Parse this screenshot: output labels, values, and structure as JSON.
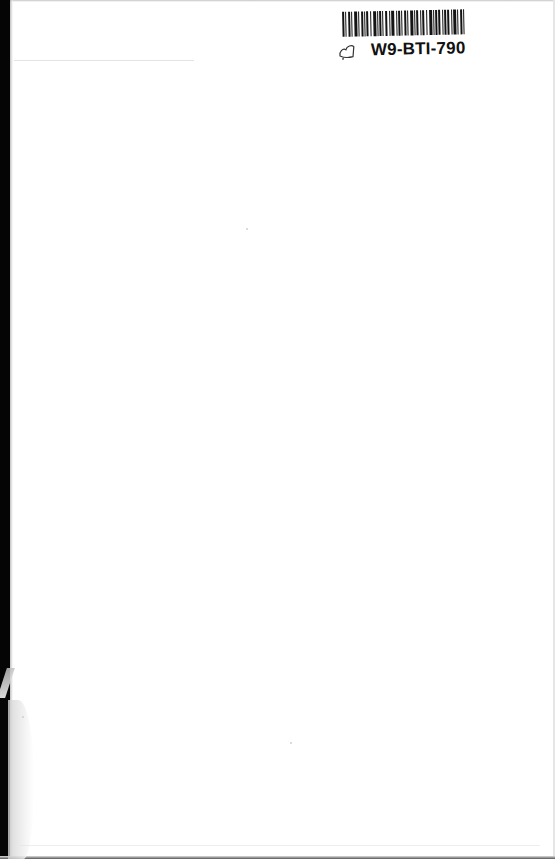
{
  "document": {
    "type": "scanned-blank-page",
    "background_color": "#ffffff",
    "binding_edge_color": "#050505"
  },
  "library_label": {
    "barcode_pattern": [
      2,
      1,
      1,
      2,
      2,
      1,
      1,
      2,
      3,
      1,
      1,
      2,
      2,
      1,
      1,
      1,
      2,
      2,
      1,
      2,
      3,
      1,
      1,
      1,
      2,
      1,
      1,
      2,
      2,
      2,
      1,
      1,
      3,
      2,
      1,
      1,
      2,
      1,
      1,
      2,
      2,
      1,
      1,
      2,
      3,
      1,
      1,
      1,
      2,
      2,
      1,
      1,
      2,
      2,
      1,
      2,
      3,
      1,
      1,
      1,
      2,
      1,
      2,
      2,
      1,
      1,
      2,
      1,
      2,
      2,
      1,
      1,
      3,
      1,
      1,
      2,
      2,
      1,
      1,
      2
    ],
    "identifier": "W9-BTI-790",
    "hand_mark_icon": "handwritten-mark-icon"
  }
}
